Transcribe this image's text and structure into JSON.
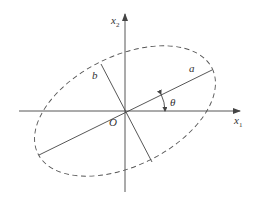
{
  "diagram": {
    "type": "rotated-ellipse",
    "colors": {
      "stroke": "#444444",
      "text": "#333333",
      "background": "#ffffff"
    },
    "labels": {
      "x_axis": "x",
      "x_axis_sub": "1",
      "y_axis": "x",
      "y_axis_sub": "2",
      "origin": "O",
      "semi_major": "a",
      "semi_minor": "b",
      "angle": "θ"
    },
    "elements": [
      "horizontal axis x1 with arrow",
      "vertical axis x2 with arrow",
      "dashed ellipse centered at origin, rotated by θ",
      "major axis segment (length 2a) along rotation angle",
      "minor axis segment (length 2b) perpendicular to major axis",
      "angle arc with arrow from x1 axis to major axis labelled θ"
    ]
  }
}
